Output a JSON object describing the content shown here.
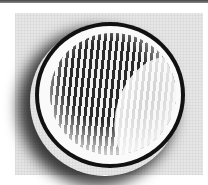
{
  "image": {
    "subject": "circular-lens-with-striped-pattern",
    "colors": {
      "background": "#ffffff",
      "panel": "#e6e6e6",
      "ring": "#111111",
      "rim": "#fafafa",
      "stripe_dark": "#2a2a2a",
      "stripe_light": "#f2f2f2"
    }
  }
}
